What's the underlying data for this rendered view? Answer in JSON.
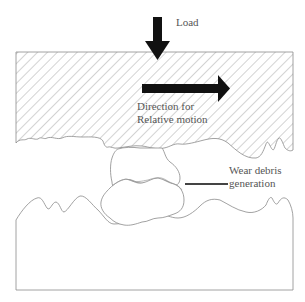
{
  "diagram": {
    "type": "wear-mechanism-schematic",
    "labels": {
      "load": "Load",
      "direction_line1": "Direction for",
      "direction_line2": "Relative motion",
      "debris_line1": "Wear debris",
      "debris_line2": "generation"
    },
    "elements": [
      {
        "id": "upper-body",
        "fill": "diagonal-hatch"
      },
      {
        "id": "lower-body",
        "fill": "none"
      },
      {
        "id": "debris-particle-upper"
      },
      {
        "id": "debris-particle-lower"
      },
      {
        "id": "load-arrow",
        "direction": "down"
      },
      {
        "id": "motion-arrow",
        "direction": "right"
      },
      {
        "id": "debris-leader-line"
      }
    ],
    "colors": {
      "outline": "#8a8a8a",
      "hatch": "#a8a8a8",
      "arrow": "#111111",
      "text": "#555555"
    }
  }
}
